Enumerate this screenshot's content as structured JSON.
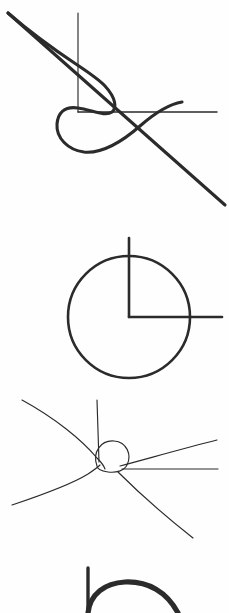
{
  "page": {
    "width": 229,
    "height": 613,
    "background_color": "#ffffff",
    "ink_color": "#2b2b2b"
  },
  "figures": [
    {
      "id": "loop-crossing",
      "title": "Curve with loop and straight crossings",
      "panel_top": 0,
      "panel_height": 210,
      "elements": {
        "vertical_line": {
          "x": 78,
          "y_top": 13,
          "y_bottom": 112
        },
        "horizontal_line": {
          "y": 112,
          "x_left": 78,
          "x_right": 217
        },
        "diagonal_line": {
          "x1": 8,
          "y1": 13,
          "x2": 225,
          "y2": 205
        },
        "loop_curve": "large teardrop loop below-left of the junction, crossing the diagonal"
      }
    },
    {
      "id": "circle-corner",
      "title": "Circle with inscribed right-angle corner",
      "panel_top": 210,
      "panel_height": 180,
      "elements": {
        "circle": {
          "cx": 129,
          "cy": 317,
          "r": 61
        },
        "vertical_line": {
          "x": 129,
          "y_top": 238,
          "y_bottom": 317
        },
        "horizontal_line": {
          "y": 317,
          "x_left": 129,
          "x_right": 222
        }
      }
    },
    {
      "id": "multi-radial",
      "title": "Small loop node with five radiating curves",
      "panel_top": 390,
      "panel_height": 160,
      "elements": {
        "node": {
          "x": 110,
          "y": 465
        },
        "loop": "small circular loop above the node",
        "branches": 5
      }
    },
    {
      "id": "partial-arc",
      "title": "Partially cropped arc with vertical tail",
      "panel_top": 550,
      "panel_height": 63,
      "elements": {
        "vertical_line": {
          "x": 88,
          "y_top": 568,
          "y_bottom": 613
        },
        "arc": "thick arc sweeping right and downward, cropped at image bottom"
      }
    }
  ]
}
